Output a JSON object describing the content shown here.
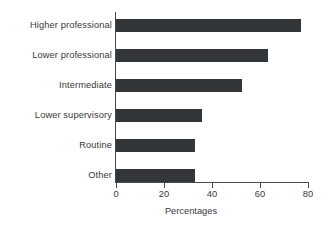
{
  "chart_data": {
    "type": "bar",
    "orientation": "horizontal",
    "title": "",
    "xlabel": "Percentages",
    "ylabel": "",
    "categories": [
      "Higher professional",
      "Lower professional",
      "Intermediate",
      "Lower supervisory",
      "Routine",
      "Other"
    ],
    "values": [
      77,
      63.5,
      52.5,
      36,
      33,
      33
    ],
    "xlim": [
      0,
      80
    ],
    "xticks": [
      0,
      20,
      40,
      60,
      80
    ],
    "xtick_labels": [
      "0",
      "20",
      "40",
      "60",
      "80"
    ],
    "grid": false,
    "legend": null,
    "bar_color": "#333638",
    "axis_color": "#4a4a4a",
    "text_color": "#39393b",
    "background_color": "#ffffff"
  }
}
